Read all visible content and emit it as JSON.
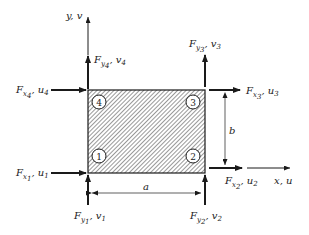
{
  "diagram": {
    "element": {
      "hatched": true,
      "width_label": "a",
      "height_label": "b"
    },
    "axes": {
      "y": {
        "label": "y, v"
      },
      "x": {
        "label": "x, u"
      }
    },
    "nodes": [
      {
        "id": "1",
        "position": "bottom-left"
      },
      {
        "id": "2",
        "position": "bottom-right"
      },
      {
        "id": "3",
        "position": "top-right"
      },
      {
        "id": "4",
        "position": "top-left"
      }
    ],
    "forces": {
      "fx1": {
        "F": "F",
        "sub1": "x",
        "sub2": "1",
        "disp": "u",
        "dsub": "1"
      },
      "fy1": {
        "F": "F",
        "sub1": "y",
        "sub2": "1",
        "disp": "v",
        "dsub": "1"
      },
      "fx2": {
        "F": "F",
        "sub1": "x",
        "sub2": "2",
        "disp": "u",
        "dsub": "2"
      },
      "fy2": {
        "F": "F",
        "sub1": "y",
        "sub2": "2",
        "disp": "v",
        "dsub": "2"
      },
      "fx3": {
        "F": "F",
        "sub1": "x",
        "sub2": "3",
        "disp": "u",
        "dsub": "3"
      },
      "fy3": {
        "F": "F",
        "sub1": "y",
        "sub2": "3",
        "disp": "v",
        "dsub": "3"
      },
      "fx4": {
        "F": "F",
        "sub1": "x",
        "sub2": "4",
        "disp": "u",
        "dsub": "4"
      },
      "fy4": {
        "F": "F",
        "sub1": "y",
        "sub2": "4",
        "disp": "v",
        "dsub": "4"
      }
    },
    "colors": {
      "ink": "#1a1a1a",
      "background": "#ffffff"
    }
  }
}
